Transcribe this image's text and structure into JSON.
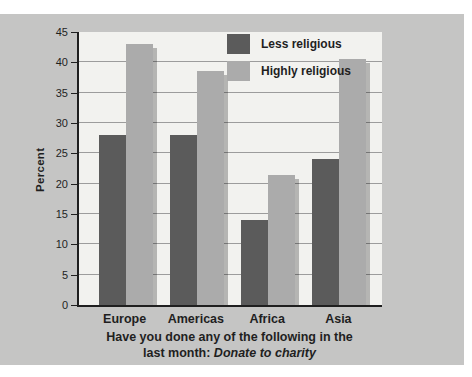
{
  "chart_data": {
    "type": "bar",
    "categories": [
      "Europe",
      "Americas",
      "Africa",
      "Asia"
    ],
    "series": [
      {
        "name": "Less religious",
        "color": "#5b5b5b",
        "values": [
          28,
          28,
          14,
          24
        ]
      },
      {
        "name": "Highly religious",
        "color": "#ababab",
        "values": [
          43,
          38.5,
          21.5,
          40.5
        ]
      }
    ],
    "title_line1": "Have you done any of the following in the",
    "title_line2_prefix": "last month: ",
    "title_line2_italic": "Donate to charity",
    "xlabel": "",
    "ylabel": "Percent",
    "ylim": [
      0,
      45
    ],
    "ytick_step": 5,
    "yticks": [
      0,
      5,
      10,
      15,
      20,
      25,
      30,
      35,
      40,
      45
    ],
    "grid": true,
    "legend_position": "top-center-inside",
    "bar_shadow": true
  },
  "colors": {
    "page_background": "#ffffff",
    "panel_background": "#c5c5c4",
    "plot_background": "#f2f2ef",
    "bar_dark": "#5b5b5b",
    "bar_light": "#ababab",
    "gridline": "#9c9c9c",
    "axis_line": "#1f1f1f",
    "text": "#1f1f1f",
    "shadow": "rgba(0,0,0,0.25)"
  }
}
